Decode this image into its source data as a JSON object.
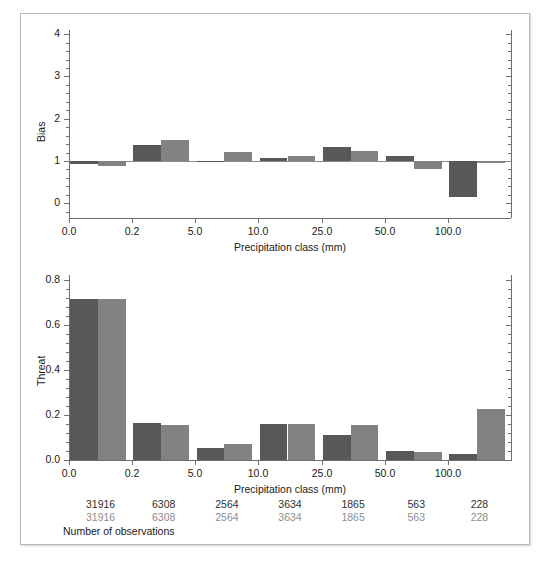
{
  "figure": {
    "background": "#ffffff",
    "border_color": "#b9b9b9",
    "series_colors": {
      "dark": "#585859",
      "light": "#828285"
    }
  },
  "observations": {
    "caption": "Number of observations",
    "rows": [
      {
        "series": "dark",
        "color": "#303030",
        "values": [
          "31916",
          "6308",
          "2564",
          "3634",
          "1865",
          "563",
          "228"
        ]
      },
      {
        "series": "light",
        "color": "#8d8d90",
        "values": [
          "31916",
          "6308",
          "2564",
          "3634",
          "1865",
          "563",
          "228"
        ]
      }
    ]
  },
  "chart_data": [
    {
      "type": "bar",
      "id": "bias",
      "title": "",
      "xlabel": "Precipitation class (mm)",
      "ylabel": "Bias",
      "categories": [
        "0.0",
        "0.2",
        "5.0",
        "10.0",
        "25.0",
        "50.0",
        "100.0"
      ],
      "xtick_labels": [
        "0.0",
        "0.2",
        "5.0",
        "10.0",
        "25.0",
        "50.0",
        "100.0"
      ],
      "ytick_labels": [
        "0",
        "1",
        "2",
        "3",
        "4"
      ],
      "ytick_values": [
        0,
        1,
        2,
        3,
        4
      ],
      "ylim": [
        -0.35,
        4.1
      ],
      "baseline": 1.0,
      "grid": false,
      "legend": "none",
      "minor_ticks": true,
      "series": [
        {
          "name": "dark",
          "color": "#585859",
          "values": [
            0.94,
            1.39,
            0.99,
            1.08,
            1.33,
            1.12,
            0.15
          ]
        },
        {
          "name": "light",
          "color": "#828285",
          "values": [
            0.88,
            1.5,
            1.21,
            1.12,
            1.24,
            0.8,
            0.95
          ]
        }
      ]
    },
    {
      "type": "bar",
      "id": "threat",
      "title": "",
      "xlabel": "Precipitation class (mm)",
      "ylabel": "Threat",
      "categories": [
        "0.0",
        "0.2",
        "5.0",
        "10.0",
        "25.0",
        "50.0",
        "100.0"
      ],
      "xtick_labels": [
        "0.0",
        "0.2",
        "5.0",
        "10.0",
        "25.0",
        "50.0",
        "100.0"
      ],
      "ytick_labels": [
        "0.0",
        "0.2",
        "0.4",
        "0.6",
        "0.8"
      ],
      "ytick_values": [
        0.0,
        0.2,
        0.4,
        0.6,
        0.8
      ],
      "ylim": [
        0,
        0.82
      ],
      "baseline": 0.0,
      "grid": false,
      "legend": "none",
      "minor_ticks": true,
      "series": [
        {
          "name": "dark",
          "color": "#585859",
          "values": [
            0.715,
            0.165,
            0.052,
            0.158,
            0.113,
            0.042,
            0.025
          ]
        },
        {
          "name": "light",
          "color": "#828285",
          "values": [
            0.715,
            0.155,
            0.07,
            0.158,
            0.157,
            0.035,
            0.225
          ]
        }
      ]
    }
  ]
}
